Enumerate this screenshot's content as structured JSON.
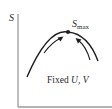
{
  "diagram": {
    "y_axis_label": "S",
    "peak_label": {
      "symbol": "S",
      "subscript": "max"
    },
    "condition_label": {
      "prefix": "Fixed ",
      "var1": "U",
      "sep": ", ",
      "var2": "V"
    },
    "curve": {
      "shape": "concave-down arc",
      "peak_marker": "dot"
    },
    "arrows": [
      "left-side arrow pointing toward maximum",
      "right-side arrow pointing toward maximum"
    ],
    "colors": {
      "axis": "#9a9a9a",
      "curve": "#1e1e1e",
      "text": "#2a2a2a"
    }
  }
}
